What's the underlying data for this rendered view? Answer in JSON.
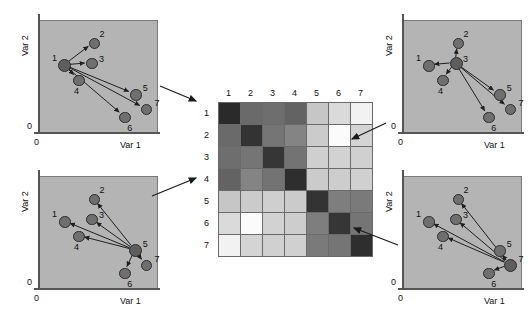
{
  "figure": {
    "title": "",
    "axis": {
      "x_label": "Var 1",
      "y_label": "Var 2",
      "origin_label": "0"
    }
  },
  "panels": [
    {
      "id": "panel-top-left",
      "hub": 1,
      "x_label": "Var 1",
      "y_label": "Var 2",
      "origin_x": "0",
      "origin_y": "0",
      "points": [
        {
          "label": "1",
          "x": 22,
          "y": 40
        },
        {
          "label": "2",
          "x": 47,
          "y": 20
        },
        {
          "label": "3",
          "x": 45,
          "y": 38
        },
        {
          "label": "4",
          "x": 34,
          "y": 53
        },
        {
          "label": "5",
          "x": 82,
          "y": 66
        },
        {
          "label": "6",
          "x": 73,
          "y": 86
        },
        {
          "label": "7",
          "x": 91,
          "y": 79
        }
      ]
    },
    {
      "id": "panel-top-right",
      "hub": 3,
      "x_label": "Var 1",
      "y_label": "Var 2",
      "origin_x": "0",
      "origin_y": "0",
      "points": [
        {
          "label": "1",
          "x": 22,
          "y": 40
        },
        {
          "label": "2",
          "x": 47,
          "y": 20
        },
        {
          "label": "3",
          "x": 45,
          "y": 38
        },
        {
          "label": "4",
          "x": 34,
          "y": 53
        },
        {
          "label": "5",
          "x": 82,
          "y": 66
        },
        {
          "label": "6",
          "x": 73,
          "y": 86
        },
        {
          "label": "7",
          "x": 91,
          "y": 79
        }
      ]
    },
    {
      "id": "panel-bottom-left",
      "hub": 5,
      "x_label": "Var 1",
      "y_label": "Var 2",
      "origin_x": "0",
      "origin_y": "0",
      "points": [
        {
          "label": "1",
          "x": 22,
          "y": 40
        },
        {
          "label": "2",
          "x": 47,
          "y": 20
        },
        {
          "label": "3",
          "x": 45,
          "y": 38
        },
        {
          "label": "4",
          "x": 34,
          "y": 53
        },
        {
          "label": "5",
          "x": 82,
          "y": 66
        },
        {
          "label": "6",
          "x": 73,
          "y": 86
        },
        {
          "label": "7",
          "x": 91,
          "y": 79
        }
      ]
    },
    {
      "id": "panel-bottom-right",
      "hub": 7,
      "x_label": "Var 1",
      "y_label": "Var 2",
      "origin_x": "0",
      "origin_y": "0",
      "points": [
        {
          "label": "1",
          "x": 22,
          "y": 40
        },
        {
          "label": "2",
          "x": 47,
          "y": 20
        },
        {
          "label": "3",
          "x": 45,
          "y": 38
        },
        {
          "label": "4",
          "x": 34,
          "y": 53
        },
        {
          "label": "5",
          "x": 82,
          "y": 66
        },
        {
          "label": "6",
          "x": 73,
          "y": 86
        },
        {
          "label": "7",
          "x": 91,
          "y": 79
        }
      ]
    }
  ],
  "chart_data": {
    "type": "heatmap",
    "title": "",
    "xlabel": "",
    "ylabel": "",
    "categories": [
      "1",
      "2",
      "3",
      "4",
      "5",
      "6",
      "7"
    ],
    "row_labels": [
      "1",
      "2",
      "3",
      "4",
      "5",
      "6",
      "7"
    ],
    "col_labels": [
      "1",
      "2",
      "3",
      "4",
      "5",
      "6",
      "7"
    ],
    "legend": [],
    "grid": true,
    "colormap": "grayscale-inverted",
    "value_range": [
      0,
      1
    ],
    "note": "Dark = small distance (similar), light = large distance (dissimilar). Diagonal is darkest (self-distance 0).",
    "values": [
      [
        0.02,
        0.3,
        0.32,
        0.28,
        0.68,
        0.78,
        0.92
      ],
      [
        0.3,
        0.04,
        0.34,
        0.4,
        0.7,
        0.95,
        0.76
      ],
      [
        0.32,
        0.34,
        0.05,
        0.33,
        0.72,
        0.74,
        0.73
      ],
      [
        0.28,
        0.4,
        0.33,
        0.03,
        0.7,
        0.72,
        0.74
      ],
      [
        0.68,
        0.7,
        0.72,
        0.7,
        0.04,
        0.38,
        0.36
      ],
      [
        0.78,
        0.95,
        0.74,
        0.72,
        0.38,
        0.05,
        0.34
      ],
      [
        0.92,
        0.76,
        0.73,
        0.74,
        0.36,
        0.34,
        0.03
      ]
    ],
    "cell_colors": [
      [
        "#2a2a2a",
        "#6a6a6a",
        "#6e6e6e",
        "#636363",
        "#c6c6c6",
        "#dadada",
        "#f2f2f2"
      ],
      [
        "#6a6a6a",
        "#333333",
        "#757575",
        "#848484",
        "#cbcbcb",
        "#fbfbfb",
        "#d4d4d4"
      ],
      [
        "#6e6e6e",
        "#757575",
        "#363636",
        "#737373",
        "#cfcfcf",
        "#d2d2d2",
        "#d0d0d0"
      ],
      [
        "#636363",
        "#848484",
        "#737373",
        "#2e2e2e",
        "#cbcbcb",
        "#cdcdcd",
        "#d0d0d0"
      ],
      [
        "#c6c6c6",
        "#cbcbcb",
        "#cfcfcf",
        "#cbcbcb",
        "#333333",
        "#7e7e7e",
        "#7a7a7a"
      ],
      [
        "#dadada",
        "#fbfbfb",
        "#d2d2d2",
        "#cdcdcd",
        "#7e7e7e",
        "#363636",
        "#757575"
      ],
      [
        "#f2f2f2",
        "#d4d4d4",
        "#d0d0d0",
        "#d0d0d0",
        "#7a7a7a",
        "#757575",
        "#2e2e2e"
      ]
    ]
  },
  "connectors": [
    {
      "name": "connector-top-left-to-row-1",
      "from_panel": "panel-top-left",
      "to_row": "1"
    },
    {
      "name": "connector-bottom-left-to-row-3",
      "from_panel": "panel-bottom-left",
      "to_row": "3"
    },
    {
      "name": "connector-top-right-to-row-5",
      "from_panel": "panel-top-right",
      "to_row": "5"
    },
    {
      "name": "connector-bottom-right-to-row-7",
      "from_panel": "panel-bottom-right",
      "to_row": "7"
    }
  ],
  "colors": {
    "panel_background": "#b4b4b4",
    "point_fill": "#6f6f6f",
    "point_stroke": "#2b2b2b",
    "axis": "#555555",
    "text": "#111111"
  }
}
